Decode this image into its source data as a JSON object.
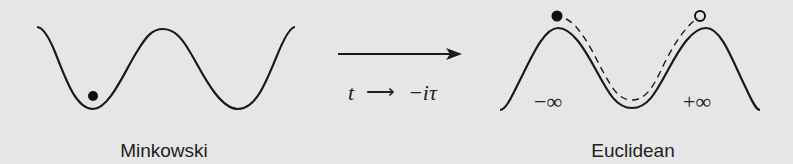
{
  "panels": {
    "left": {
      "label": "Minkowski"
    },
    "right": {
      "label": "Euclidean",
      "minus_inf": "−∞",
      "plus_inf": "+∞"
    }
  },
  "transform": {
    "t": "t",
    "arrow": "⟶",
    "result": "−iτ"
  },
  "colors": {
    "background": "#e6e6e6",
    "stroke": "#1a1a1a"
  }
}
